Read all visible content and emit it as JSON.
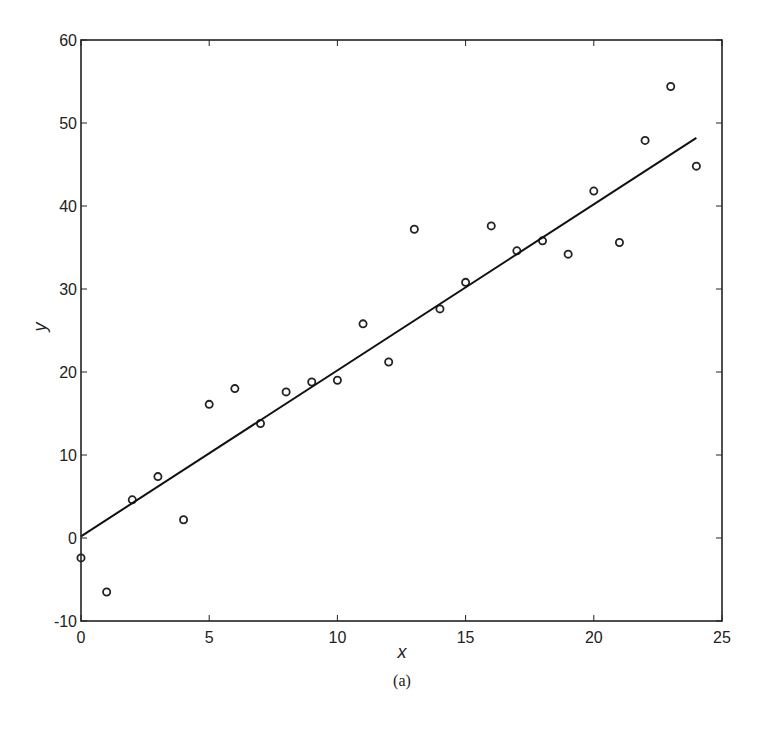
{
  "figure": {
    "caption": "(a)"
  },
  "chart_data": {
    "type": "scatter",
    "title": "",
    "caption": "(a)",
    "xlabel": "x",
    "ylabel": "y",
    "xlim": [
      0,
      25
    ],
    "ylim": [
      -10,
      60
    ],
    "xticks": [
      0,
      5,
      10,
      15,
      20,
      25
    ],
    "yticks": [
      -10,
      0,
      10,
      20,
      30,
      40,
      50,
      60
    ],
    "xtick_labels": [
      "0",
      "5",
      "10",
      "15",
      "20",
      "25"
    ],
    "ytick_labels": [
      "-10",
      "0",
      "10",
      "20",
      "30",
      "40",
      "50",
      "60"
    ],
    "grid": false,
    "legend": null,
    "series": [
      {
        "name": "data",
        "kind": "scatter",
        "marker": "open-circle",
        "x": [
          0,
          1,
          2,
          3,
          4,
          5,
          6,
          7,
          8,
          9,
          10,
          11,
          12,
          13,
          14,
          15,
          16,
          17,
          18,
          19,
          20,
          21,
          22,
          23,
          24
        ],
        "y": [
          -2.4,
          -6.5,
          4.6,
          7.4,
          2.2,
          16.1,
          18.0,
          13.8,
          17.6,
          18.8,
          19.0,
          25.8,
          21.2,
          37.2,
          27.6,
          30.8,
          37.6,
          34.6,
          35.8,
          34.2,
          41.8,
          35.6,
          47.9,
          54.4,
          44.8
        ]
      },
      {
        "name": "fit",
        "kind": "line",
        "x": [
          0,
          24
        ],
        "y": [
          0.2,
          48.2
        ]
      }
    ]
  }
}
